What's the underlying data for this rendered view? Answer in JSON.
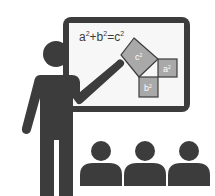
{
  "illustration": {
    "subject": "teacher presenting Pythagorean theorem to students",
    "formula": {
      "base_a": "a",
      "base_b": "b",
      "base_c": "c",
      "exp": "2",
      "plus": "+",
      "equals": "="
    },
    "squares": {
      "c_label": "c",
      "a_label": "a",
      "b_label": "b",
      "exp": "2"
    },
    "student_count": 3,
    "colors": {
      "dark": "#3c3c3c",
      "board_fill": "#f7f7f7",
      "square_fill": "#a9a9a9",
      "square_label": "#ffffff"
    }
  }
}
